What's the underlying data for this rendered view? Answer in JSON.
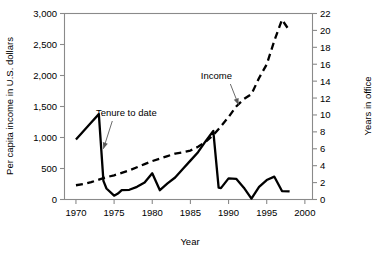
{
  "chart_data": {
    "type": "line",
    "title": "",
    "xlabel": "Year",
    "ylabel": "Per capita income in U.S. dollars",
    "y2label": "Years in office",
    "xlim": [
      1968.5,
      2001.0
    ],
    "ylim": [
      0,
      3000
    ],
    "y2lim": [
      0,
      22
    ],
    "grid": false,
    "legend": "none (inline annotations with leader arrows)",
    "xticks": [
      "1970",
      "1975",
      "1980",
      "1985",
      "1990",
      "1995",
      "2000"
    ],
    "xtick_values": [
      1970,
      1975,
      1980,
      1985,
      1990,
      1995,
      2000
    ],
    "yticks": [
      "0",
      "500",
      "1,000",
      "1,500",
      "2,000",
      "2,500",
      "3,000"
    ],
    "ytick_values": [
      0,
      500,
      1000,
      1500,
      2000,
      2500,
      3000
    ],
    "y2ticks": [
      "0",
      "2",
      "4",
      "6",
      "8",
      "10",
      "12",
      "14",
      "16",
      "18",
      "20",
      "22"
    ],
    "y2tick_values": [
      0,
      2,
      4,
      6,
      8,
      10,
      12,
      14,
      16,
      18,
      20,
      22
    ],
    "annotations": [
      {
        "text": "Tenure to date",
        "x": 1976.6,
        "y_px": 116,
        "points_to_series": "Tenure to date",
        "target_x": 1973.6,
        "target_y": 6.0
      },
      {
        "text": "Income",
        "x": 1988.4,
        "y_px": 79,
        "points_to_series": "Income",
        "target_x": 1991.3,
        "target_y": 1530
      }
    ],
    "series": [
      {
        "name": "Income",
        "axis": "left",
        "style": "dashed",
        "unit": "U.S. dollars",
        "x": [
          1970,
          1971,
          1972,
          1973,
          1974,
          1975,
          1976,
          1977,
          1978,
          1979,
          1980,
          1981,
          1982,
          1983,
          1984,
          1985,
          1986,
          1987,
          1988,
          1989,
          1990,
          1991,
          1992,
          1993,
          1994,
          1995,
          1996,
          1997,
          1998
        ],
        "values": [
          230,
          250,
          280,
          320,
          360,
          390,
          430,
          470,
          520,
          570,
          620,
          660,
          700,
          740,
          760,
          790,
          850,
          930,
          1040,
          1180,
          1330,
          1500,
          1620,
          1700,
          1960,
          2180,
          2560,
          2900,
          2720
        ]
      },
      {
        "name": "Tenure to date",
        "axis": "right",
        "style": "solid",
        "unit": "years in office",
        "x": [
          1970,
          1971,
          1972,
          1973,
          1973.6,
          1974,
          1975,
          1975.5,
          1976,
          1977,
          1978,
          1979,
          1980,
          1981,
          1982,
          1983,
          1984,
          1985,
          1986,
          1987,
          1988,
          1988.7,
          1989,
          1990,
          1991,
          1992,
          1993,
          1994,
          1995,
          1996,
          1997,
          1998
        ],
        "values": [
          7.1,
          8.1,
          9.1,
          10.1,
          2.2,
          1.3,
          0.45,
          0.7,
          1.1,
          1.15,
          1.5,
          2.0,
          3.1,
          1.1,
          1.9,
          2.6,
          3.6,
          4.6,
          5.6,
          6.9,
          8.1,
          1.4,
          1.35,
          2.5,
          2.45,
          1.4,
          0.1,
          1.5,
          2.3,
          2.7,
          1.0,
          0.95
        ]
      }
    ]
  },
  "colors": {
    "line": "#000000",
    "frame": "#8a8a8a",
    "leader": "#5a5a5a",
    "background": "#ffffff"
  }
}
